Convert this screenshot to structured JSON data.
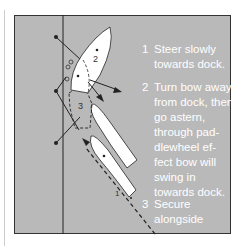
{
  "diagram": {
    "boat_labels": [
      "1",
      "2",
      "3"
    ],
    "steps": [
      {
        "num": "1",
        "text": "Steer slowly towards dock."
      },
      {
        "num": "2",
        "text": "Turn bow away from dock, then go astern, through pad-dlewheel ef-fect bow will swing in towards dock."
      },
      {
        "num": "3",
        "text": "Secure alongside"
      }
    ],
    "colors": {
      "water": "#b9b9b9",
      "boat": "#ffffff",
      "line": "#222222",
      "text": "#ffffff"
    }
  }
}
